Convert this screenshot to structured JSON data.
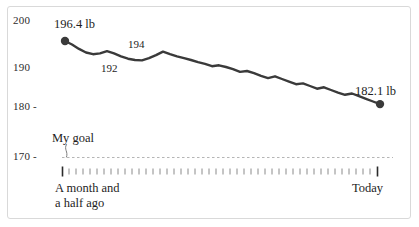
{
  "card": {
    "border_color": "#d9d9d9",
    "background": "#ffffff"
  },
  "colors": {
    "line": "#3a3a3a",
    "goal_line": "#b5b5b5",
    "tick": "#8a8a8a",
    "tick_strong": "#2b2b2b",
    "text": "#1d1d1d",
    "axis_text": "#2b2b2b"
  },
  "axis": {
    "y_ticks": [
      {
        "label": "200",
        "dash": ""
      },
      {
        "label": "190",
        "dash": ""
      },
      {
        "label": "180",
        "dash": "-"
      },
      {
        "label": "170",
        "dash": "-"
      }
    ],
    "x_start_caption": "A month and\na half ago",
    "x_end_caption": "Today"
  },
  "annotations": {
    "goal_label": "My goal",
    "start_label": "196.4 lb",
    "trough_label": "192",
    "peak_label": "194",
    "end_label": "182.1 lb"
  },
  "chart_data": {
    "type": "line",
    "title": "",
    "subtitle": "",
    "xlabel": "",
    "ylabel": "",
    "ylim": [
      168,
      201
    ],
    "yticks": [
      170,
      180,
      190,
      200
    ],
    "grid": false,
    "legend": null,
    "x_axis_type": "date-index",
    "x_start_caption": "A month and a half ago",
    "x_end_caption": "Today",
    "goal_line": {
      "value": 170,
      "label": "My goal",
      "style": "dashed",
      "color": "#b5b5b5"
    },
    "point_labels": [
      {
        "index": 0,
        "value": 196.4,
        "text": "196.4 lb",
        "position": "above"
      },
      {
        "index": 11,
        "value": 192.0,
        "text": "192",
        "position": "below"
      },
      {
        "index": 14,
        "value": 194.0,
        "text": "194",
        "position": "above"
      },
      {
        "index": 45,
        "value": 182.1,
        "text": "182.1 lb",
        "position": "above"
      }
    ],
    "markers": [
      {
        "index": 0,
        "value": 196.4
      },
      {
        "index": 45,
        "value": 182.1
      }
    ],
    "series": [
      {
        "name": "Weight (lb)",
        "color": "#3a3a3a",
        "values": [
          196.4,
          195.6,
          194.6,
          193.8,
          193.4,
          193.6,
          194.1,
          193.6,
          192.9,
          192.4,
          192.1,
          192.0,
          192.5,
          193.2,
          194.0,
          193.4,
          192.9,
          192.5,
          192.1,
          191.6,
          191.2,
          190.7,
          190.9,
          190.5,
          190.0,
          189.4,
          189.6,
          189.1,
          188.5,
          188.0,
          188.4,
          187.8,
          187.2,
          186.6,
          186.8,
          186.2,
          185.6,
          185.9,
          185.3,
          184.7,
          184.2,
          184.5,
          183.9,
          183.3,
          182.7,
          182.1
        ]
      }
    ]
  }
}
